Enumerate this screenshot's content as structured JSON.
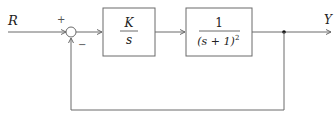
{
  "diagram": {
    "type": "control-block-diagram",
    "input_label": "R",
    "output_label": "Y",
    "summing_junction": {
      "plus_sign": "+",
      "minus_sign": "−"
    },
    "blocks": [
      {
        "name": "controller",
        "numerator": "K",
        "denominator": "s"
      },
      {
        "name": "plant",
        "numerator": "1",
        "denominator": "(s + 1)",
        "denominator_exponent": "2"
      }
    ],
    "feedback": "unity negative feedback"
  }
}
